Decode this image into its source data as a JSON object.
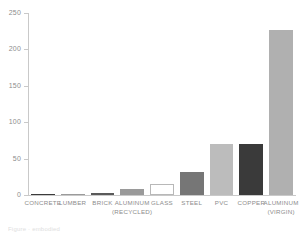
{
  "chart_data": {
    "type": "bar",
    "title": "",
    "subtitle": "",
    "xlabel": "",
    "ylabel": "",
    "ylim": [
      0,
      250
    ],
    "yticks": [
      0,
      50,
      100,
      150,
      200,
      250
    ],
    "ytick_labels": [
      "0",
      "50",
      "100",
      "150",
      "200",
      "250"
    ],
    "grid": false,
    "legend": false,
    "categories": [
      "CONCRETE",
      "LUMBER",
      "BRICK",
      "ALUMINUM (RECYCLED)",
      "GLASS",
      "STEEL",
      "PVC",
      "COPPER",
      "ALUMINUM (VIRGIN)"
    ],
    "category_lines": [
      [
        "CONCRETE",
        ""
      ],
      [
        "LUMBER",
        ""
      ],
      [
        "BRICK",
        ""
      ],
      [
        "ALUMINUM",
        "(RECYCLED)"
      ],
      [
        "GLASS",
        ""
      ],
      [
        "STEEL",
        ""
      ],
      [
        "PVC",
        ""
      ],
      [
        "COPPER",
        ""
      ],
      [
        "ALUMINUM",
        "(VIRGIN)"
      ]
    ],
    "values": [
      1,
      2,
      2.5,
      8,
      15,
      31,
      70,
      70,
      227
    ],
    "bar_colors": [
      "#3b3b3b",
      "#9b9b9b",
      "#5a5a5a",
      "#9a9a9a",
      "#ffffff",
      "#767676",
      "#bcbcbc",
      "#3a3a3a",
      "#b0b0b0"
    ],
    "bar_border_colors": [
      "#3b3b3b",
      "#9b9b9b",
      "#5a5a5a",
      "#9a9a9a",
      "#b8b8b8",
      "#767676",
      "#bcbcbc",
      "#3a3a3a",
      "#b0b0b0"
    ],
    "axis_color": "#c9c9c9",
    "tick_label_color": "#8d8d8d",
    "background_color": "#ffffff"
  },
  "caption": {
    "text": "Figure  ·  embodied"
  }
}
